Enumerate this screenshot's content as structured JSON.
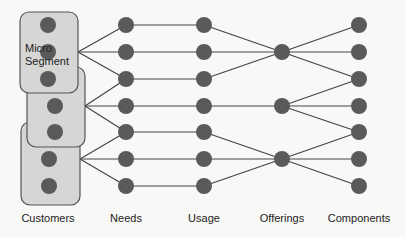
{
  "diagram": {
    "title": "",
    "colors": {
      "background": "#f8f8f6",
      "node": "#5a5a5a",
      "box_fill": "#d6d6d4",
      "box_stroke": "#555555",
      "edge": "#444444"
    },
    "segment_label": [
      "Micro",
      "Segment"
    ],
    "columns": [
      {
        "id": "customers",
        "label": "Customers",
        "x": 48
      },
      {
        "id": "needs",
        "label": "Needs",
        "x": 126
      },
      {
        "id": "usage",
        "label": "Usage",
        "x": 204
      },
      {
        "id": "offerings",
        "label": "Offerings",
        "x": 282
      },
      {
        "id": "components",
        "label": "Components",
        "x": 359
      }
    ],
    "rows_y": [
      25,
      52,
      79,
      106,
      132,
      159,
      186
    ],
    "micro_segments": [
      {
        "x": 20,
        "y": 12,
        "w": 58,
        "h": 81,
        "node_rows": [
          0,
          1,
          2
        ],
        "node_x": 48,
        "hub": [
          78,
          52
        ],
        "targets": [
          0,
          1,
          2
        ]
      },
      {
        "x": 27,
        "y": 67,
        "w": 58,
        "h": 80,
        "node_rows": [
          3,
          4
        ],
        "node_x": 55,
        "hub": [
          85,
          106
        ],
        "targets": [
          2,
          3,
          4
        ]
      },
      {
        "x": 21,
        "y": 122,
        "w": 59,
        "h": 83,
        "node_rows": [
          5,
          6
        ],
        "node_x": 49,
        "hub": [
          80,
          159
        ],
        "targets": [
          4,
          5,
          6
        ]
      }
    ],
    "offering_nodes": [
      {
        "row": 1,
        "from_usage": [
          0,
          1,
          2
        ],
        "to_components": [
          0,
          1,
          2
        ]
      },
      {
        "row": 3,
        "from_usage": [
          3
        ],
        "to_components": [
          2,
          3,
          4
        ]
      },
      {
        "row": 5,
        "from_usage": [
          4,
          5,
          6
        ],
        "to_components": [
          4,
          5,
          6
        ]
      }
    ]
  }
}
